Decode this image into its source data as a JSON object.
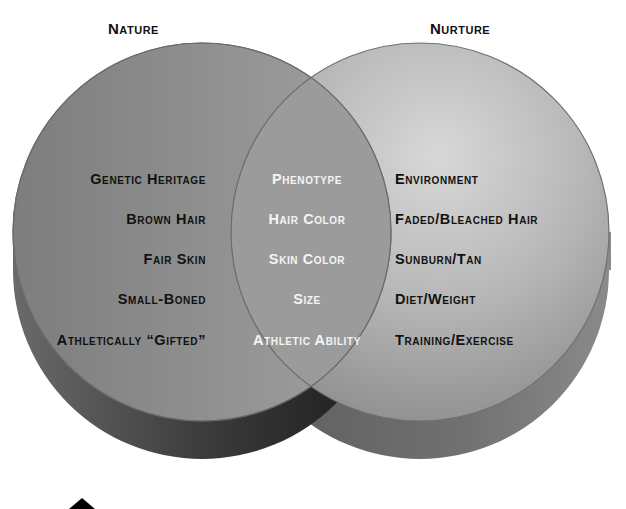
{
  "diagram": {
    "type": "venn",
    "style": "3d-extruded",
    "colors": {
      "left_top": "#8e8e8e",
      "left_side": "#3a3a3a",
      "right_top": "#b9b9b9",
      "right_side": "#6e6e6e",
      "overlap": "#9a9a9a",
      "outline": "#6a6a6a"
    },
    "sets": {
      "left": {
        "title": "Nature",
        "items": [
          "Genetic Heritage",
          "Brown Hair",
          "Fair Skin",
          "Small-Boned",
          "Athletically “Gifted”"
        ]
      },
      "overlap": {
        "items": [
          "Phenotype",
          "Hair Color",
          "Skin Color",
          "Size",
          "Athletic Ability"
        ]
      },
      "right": {
        "title": "Nurture",
        "items": [
          "Environment",
          "Faded/Bleached Hair",
          "Sunburn/Tan",
          "Diet/Weight",
          "Training/Exercise"
        ]
      }
    }
  }
}
